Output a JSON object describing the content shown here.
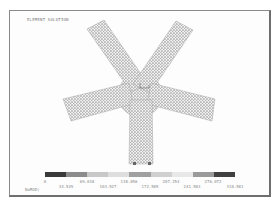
{
  "plot": {
    "title": "ELEMENT SOLUTION",
    "units_label": "NoMOD)",
    "mesh_shape": "five-arm star",
    "mesh_color": "#a8a8a8",
    "center_marker": "MX"
  },
  "legend": {
    "colors": [
      "#3a3a3a",
      "#8c8c8c",
      "#c8c8c8",
      "#dedede",
      "#a0a0a0",
      "#d0d0d0",
      "#e8e8e8",
      "#9a9a9a",
      "#404040"
    ],
    "labels_top": [
      "0",
      "69.018",
      "138.056",
      "207.254",
      "276.072"
    ],
    "labels_bottom": [
      "34.529",
      "103.527",
      "172.585",
      "241.583",
      "310.581"
    ]
  }
}
